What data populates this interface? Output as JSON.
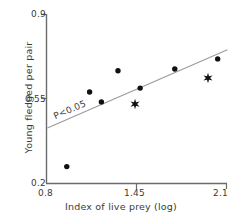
{
  "chart_data": {
    "type": "scatter",
    "title": "",
    "xlabel": "Index of live prey (log)",
    "ylabel": "Young fledged per pair",
    "xlim": [
      0.8,
      2.1
    ],
    "ylim": [
      0.2,
      0.9
    ],
    "xticks": [
      "0.8",
      "1.45",
      "2.1"
    ],
    "xtick_values": [
      0.8,
      1.45,
      2.1
    ],
    "yticks": [
      "0.2",
      "0.55",
      "0.9"
    ],
    "ytick_values": [
      0.2,
      0.55,
      0.9
    ],
    "grid": false,
    "legend": null,
    "annotations": [
      {
        "text": "P<0.05",
        "x": 0.82,
        "y": 0.5,
        "rotation": -23.5
      }
    ],
    "series": [
      {
        "name": "circle-points",
        "marker": "circle",
        "color": "#111111",
        "points": [
          {
            "x": 0.95,
            "y": 0.268
          },
          {
            "x": 1.115,
            "y": 0.577
          },
          {
            "x": 1.2,
            "y": 0.536
          },
          {
            "x": 1.32,
            "y": 0.665
          },
          {
            "x": 1.48,
            "y": 0.593
          },
          {
            "x": 1.73,
            "y": 0.672
          },
          {
            "x": 2.04,
            "y": 0.714
          }
        ]
      },
      {
        "name": "star-points",
        "marker": "star",
        "color": "#111111",
        "points": [
          {
            "x": 1.443,
            "y": 0.527
          },
          {
            "x": 1.97,
            "y": 0.635
          }
        ]
      }
    ],
    "fit_line": {
      "name": "regression-line",
      "color": "#9a9a9a",
      "x1": 0.81,
      "y1": 0.428,
      "x2": 2.11,
      "y2": 0.752
    },
    "axis_color": "#6b6b6b"
  }
}
